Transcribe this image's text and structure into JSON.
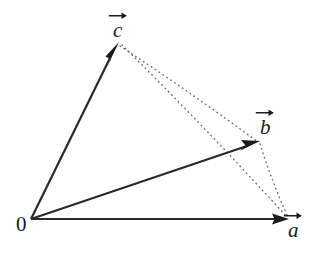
{
  "figure": {
    "background_color": "#ffffff",
    "stroke_color": "#2a2a2a",
    "dotted_color": "#6b6b6b",
    "width": 321,
    "height": 258
  },
  "origin": {
    "label": "0",
    "x": 31,
    "y": 219
  },
  "vectors": [
    {
      "name": "a",
      "label": "a",
      "tip_x": 288,
      "tip_y": 219,
      "style": "solid",
      "arrowhead": "filled-triangle"
    },
    {
      "name": "b",
      "label": "b",
      "tip_x": 259,
      "tip_y": 142,
      "style": "solid",
      "arrowhead": "filled-triangle"
    },
    {
      "name": "c",
      "label": "c",
      "tip_x": 118,
      "tip_y": 43,
      "style": "solid",
      "arrowhead": "filled-triangle"
    }
  ],
  "construction_lines": [
    {
      "name": "c-to-b",
      "from": "c",
      "to": "b",
      "style": "dotted"
    },
    {
      "name": "c-to-a",
      "from": "c",
      "to": "a",
      "style": "dotted"
    },
    {
      "name": "b-to-a",
      "from": "b",
      "to": "a",
      "style": "dotted"
    }
  ],
  "labels": {
    "origin": "0",
    "vector_a": "a",
    "vector_b": "b",
    "vector_c": "c"
  }
}
